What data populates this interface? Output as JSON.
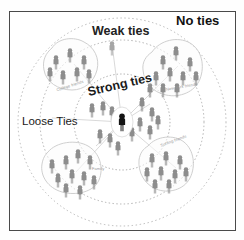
{
  "figure": {
    "title_visible": false,
    "frame": {
      "border_color": "#4a4a4a",
      "background": "#ffffff"
    }
  },
  "tie_rings": [
    {
      "id": "strong",
      "label": "Strong ties",
      "radius_px": 48,
      "style": "dotted"
    },
    {
      "id": "weak",
      "label": "Weak ties",
      "radius_px": 82,
      "style": "dotted"
    },
    {
      "id": "no",
      "label": "No ties",
      "radius_px": 104,
      "style": "dotted"
    }
  ],
  "labels": {
    "no_ties": "No ties",
    "weak_ties": "Weak ties",
    "strong_ties": "Strong ties",
    "loose_ties": "Loose Ties"
  },
  "clusters": [
    {
      "id": "college-friends",
      "label": "College friends",
      "position": "upper-left",
      "people_count": 7
    },
    {
      "id": "new-york-friends",
      "label": "New York friends",
      "position": "upper-right",
      "people_count": 10
    },
    {
      "id": "surfing-friends",
      "label": "Surfing friends",
      "position": "lower-right",
      "people_count": 9
    },
    {
      "id": "family",
      "label": "Family",
      "position": "lower-left",
      "people_count": 10
    },
    {
      "id": "strong-tie-core",
      "label": "",
      "position": "center",
      "people_count": 12
    }
  ],
  "ego": {
    "id": "ego-person",
    "color": "#141414",
    "label": ""
  },
  "colors": {
    "person_gray": "#8d8d8d",
    "person_gray_light": "#a6a6a6",
    "ego_black": "#141414",
    "ring_dotted": "#b4b4b4",
    "blob_outline": "#c9c9c9",
    "connector": "#cfcfcf",
    "frame": "#4a4a4a",
    "text_dark": "#111111",
    "text_cluster": "#9a9a9a"
  }
}
